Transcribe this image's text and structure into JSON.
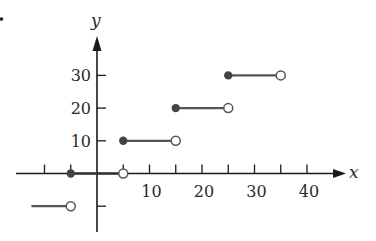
{
  "chart_data": {
    "type": "line",
    "subtype": "step_function",
    "title": "",
    "xlabel": "x",
    "ylabel": "y",
    "xlim": [
      -15,
      45
    ],
    "ylim": [
      -13,
      37
    ],
    "grid": false,
    "legend": null,
    "x_ticks": [
      -10,
      -5,
      5,
      10,
      15,
      20,
      25,
      30,
      35,
      40
    ],
    "x_tick_labels": [
      "10",
      "20",
      "30",
      "40"
    ],
    "x_tick_label_values": [
      10,
      20,
      30,
      40
    ],
    "y_ticks": [
      -10,
      10,
      20,
      30
    ],
    "y_tick_labels": [
      "10",
      "20",
      "30"
    ],
    "y_tick_label_values": [
      10,
      20,
      30
    ],
    "segments": [
      {
        "x_start": -12.5,
        "x_end": -5,
        "y": -10,
        "start_closed": null,
        "end_closed": false
      },
      {
        "x_start": -5,
        "x_end": 5,
        "y": 0,
        "start_closed": true,
        "end_closed": false
      },
      {
        "x_start": 5,
        "x_end": 15,
        "y": 10,
        "start_closed": true,
        "end_closed": false
      },
      {
        "x_start": 15,
        "x_end": 25,
        "y": 20,
        "start_closed": true,
        "end_closed": false
      },
      {
        "x_start": 25,
        "x_end": 35,
        "y": 30,
        "start_closed": true,
        "end_closed": false
      }
    ],
    "colors": {
      "axis": "#1a1a1a",
      "segment": "#555555",
      "filled_dot": "#444444",
      "open_dot_stroke": "#555555"
    }
  }
}
